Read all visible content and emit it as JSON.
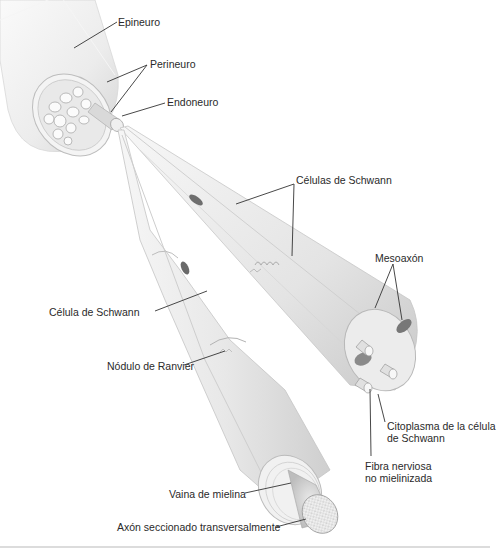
{
  "diagram": {
    "labels": {
      "epineuro": "Epineuro",
      "perineuro": "Perineuro",
      "endoneuro": "Endoneuro",
      "celulas_schwann": "Células de Schwann",
      "mesoaxon": "Mesoaxón",
      "celula_schwann": "Célula de Schwann",
      "nodulo_ranvier": "Nódulo de Ranvier",
      "citoplasma_line1": "Citoplasma de la célula",
      "citoplasma_line2": "de Schwann",
      "fibra_line1": "Fibra nerviosa",
      "fibra_line2": "no mielinizada",
      "vaina_mielina": "Vaina de mielina",
      "axon": "Axón seccionado transversalmente"
    },
    "colors": {
      "tissue_light": "#f2f2f2",
      "tissue_mid": "#dcdcdc",
      "tissue_shadow": "#b8b8b8",
      "nucleus": "#6e6e6e",
      "leader_line": "#333333",
      "text": "#2a2a2a"
    }
  }
}
